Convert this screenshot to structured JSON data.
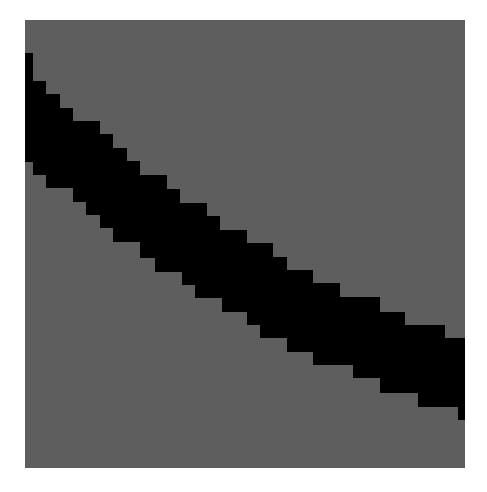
{
  "image": {
    "background": "#ffffff",
    "square": {
      "x": 25,
      "y": 20,
      "width": 440,
      "height": 448,
      "color": "#5e5e5e"
    },
    "band": {
      "color": "#000000",
      "points": "25,53 33,53 33,81 46,81 46,94 60,94 60,108 73,108 73,121 100,121 100,134 113,134 113,148 127,148 127,161 140,161 140,175 167,175 167,189 180,189 180,203 207,203 207,216 220,216 220,230 247,230 247,243 273,243 273,257 287,257 287,270 313,270 313,283 340,283 340,297 380,297 380,312 405,312 405,325 445,325 445,338 465,338 465,420 458,420 458,407 418,407 418,393 380,393 380,378 353,378 353,365 313,365 313,352 287,352 287,338 260,338 260,325 247,325 247,312 222,312 222,298 195,298 195,285 182,285 182,272 155,272 155,258 140,258 140,242 113,242 113,228 100,228 100,215 86,215 86,202 73,202 73,188 46,188 46,175 33,175 33,162 25,162"
    }
  }
}
